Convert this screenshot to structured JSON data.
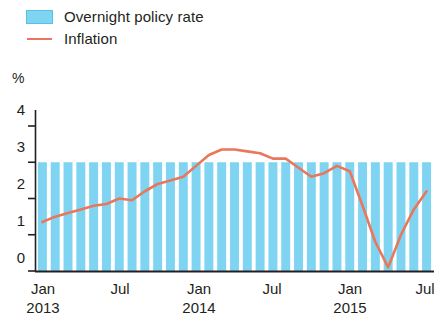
{
  "legend": {
    "items": [
      {
        "label": "Overnight policy rate",
        "type": "bar",
        "color": "#7fd4f2",
        "icon": "bar-swatch-icon"
      },
      {
        "label": "Inflation",
        "type": "line",
        "color": "#e8775c",
        "icon": "line-swatch-icon"
      }
    ]
  },
  "axis": {
    "y_unit_label": "%",
    "y_ticks": [
      "0",
      "1",
      "2",
      "3",
      "4"
    ],
    "x_ticks": [
      {
        "month": "Jan",
        "year": "2013"
      },
      {
        "month": "Jul",
        "year": ""
      },
      {
        "month": "Jan",
        "year": "2014"
      },
      {
        "month": "Jul",
        "year": ""
      },
      {
        "month": "Jan",
        "year": "2015"
      },
      {
        "month": "Jul",
        "year": ""
      }
    ]
  },
  "chart_data": {
    "type": "bar",
    "title": "",
    "xlabel": "",
    "ylabel": "%",
    "ylim": [
      0,
      4
    ],
    "yticks": [
      0,
      1,
      2,
      3,
      4
    ],
    "grid": false,
    "legend_position": "top-left",
    "categories": [
      "Jan 2013",
      "Feb 2013",
      "Mar 2013",
      "Apr 2013",
      "May 2013",
      "Jun 2013",
      "Jul 2013",
      "Aug 2013",
      "Sep 2013",
      "Oct 2013",
      "Nov 2013",
      "Dec 2013",
      "Jan 2014",
      "Feb 2014",
      "Mar 2014",
      "Apr 2014",
      "May 2014",
      "Jun 2014",
      "Jul 2014",
      "Aug 2014",
      "Sep 2014",
      "Oct 2014",
      "Nov 2014",
      "Dec 2014",
      "Jan 2015",
      "Feb 2015",
      "Mar 2015",
      "Apr 2015",
      "May 2015",
      "Jun 2015",
      "Jul 2015"
    ],
    "series": [
      {
        "name": "Overnight policy rate",
        "type": "bar",
        "color": "#7fd4f2",
        "values": [
          3.0,
          3.0,
          3.0,
          3.0,
          3.0,
          3.0,
          3.0,
          3.0,
          3.0,
          3.0,
          3.0,
          3.0,
          3.0,
          3.0,
          3.0,
          3.0,
          3.0,
          3.0,
          3.0,
          3.0,
          3.0,
          3.0,
          3.0,
          3.0,
          3.0,
          3.0,
          3.0,
          3.0,
          3.0,
          3.0,
          3.0
        ]
      },
      {
        "name": "Inflation",
        "type": "line",
        "color": "#e8775c",
        "values": [
          1.35,
          1.5,
          1.6,
          1.7,
          1.8,
          1.85,
          2.0,
          1.95,
          2.2,
          2.4,
          2.5,
          2.6,
          2.9,
          3.2,
          3.35,
          3.35,
          3.3,
          3.25,
          3.1,
          3.1,
          2.85,
          2.6,
          2.7,
          2.9,
          2.75,
          1.8,
          0.8,
          0.1,
          1.0,
          1.7,
          2.2
        ]
      }
    ]
  }
}
